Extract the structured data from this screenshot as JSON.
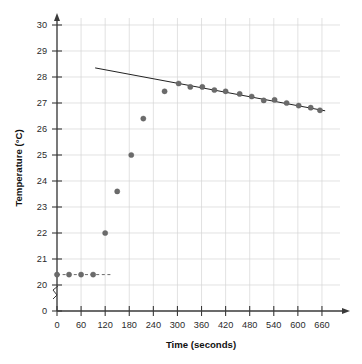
{
  "chart_data": {
    "type": "scatter",
    "title": "",
    "xlabel": "Time (seconds)",
    "ylabel": "Temperature (°C)",
    "xlim": [
      0,
      690
    ],
    "ylim": [
      19.6,
      30.6
    ],
    "grid": true,
    "legend_position": "none",
    "axis_break_y": true,
    "x_ticks": [
      0,
      60,
      120,
      180,
      240,
      300,
      360,
      420,
      480,
      540,
      600,
      660
    ],
    "x_tick_labels": [
      "0",
      "60",
      "120",
      "180",
      "240",
      "300",
      "360",
      "420",
      "480",
      "540",
      "600",
      "660"
    ],
    "y_ticks": [
      20,
      21,
      22,
      23,
      24,
      25,
      26,
      27,
      28,
      29,
      30
    ],
    "y_tick_labels": [
      "20",
      "21",
      "22",
      "23",
      "24",
      "25",
      "26",
      "27",
      "28",
      "29",
      "30"
    ],
    "y_zero_label": "0",
    "series": [
      {
        "name": "Temperature measurements",
        "marker": "circle",
        "color": "#6b6b6b",
        "points": [
          {
            "x": 0,
            "y": 20.4
          },
          {
            "x": 30,
            "y": 20.4
          },
          {
            "x": 60,
            "y": 20.4
          },
          {
            "x": 90,
            "y": 20.4
          },
          {
            "x": 120,
            "y": 22.0
          },
          {
            "x": 150,
            "y": 23.6
          },
          {
            "x": 185,
            "y": 25.0
          },
          {
            "x": 215,
            "y": 26.4
          },
          {
            "x": 268,
            "y": 27.45
          },
          {
            "x": 303,
            "y": 27.75
          },
          {
            "x": 332,
            "y": 27.62
          },
          {
            "x": 362,
            "y": 27.62
          },
          {
            "x": 392,
            "y": 27.5
          },
          {
            "x": 420,
            "y": 27.45
          },
          {
            "x": 455,
            "y": 27.35
          },
          {
            "x": 485,
            "y": 27.25
          },
          {
            "x": 515,
            "y": 27.1
          },
          {
            "x": 542,
            "y": 27.12
          },
          {
            "x": 572,
            "y": 27.0
          },
          {
            "x": 602,
            "y": 26.9
          },
          {
            "x": 632,
            "y": 26.82
          },
          {
            "x": 655,
            "y": 26.72
          }
        ]
      }
    ],
    "trend_line": {
      "name": "Extrapolated cooling line",
      "color": "#222222",
      "x_start": 95,
      "y_start": 28.35,
      "x_end": 668,
      "y_end": 26.7
    },
    "baseline_dashed": {
      "name": "Initial temperature baseline",
      "color": "#6b6b6b",
      "y": 20.4,
      "x_start": 0,
      "x_end": 133
    }
  }
}
